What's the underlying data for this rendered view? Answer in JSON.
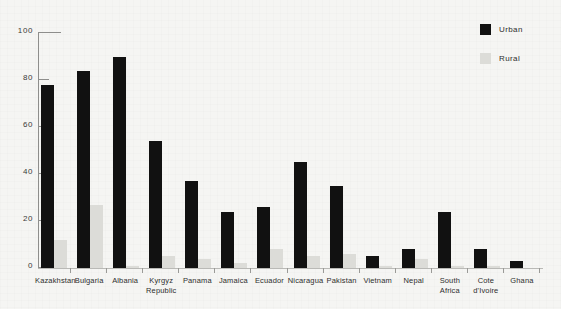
{
  "chart_data": {
    "type": "bar",
    "title": "",
    "xlabel": "",
    "ylabel": "",
    "ylim": [
      0,
      100
    ],
    "yticks": [
      0,
      20,
      40,
      60,
      80,
      100
    ],
    "grid": false,
    "legend_position": "top-right",
    "categories": [
      "Kazakhstan",
      "Bulgaria",
      "Albania",
      "Kyrgyz Republic",
      "Panama",
      "Jamaica",
      "Ecuador",
      "Nicaragua",
      "Pakistan",
      "Vietnam",
      "Nepal",
      "South Africa",
      "Cote d'Ivoire",
      "Ghana"
    ],
    "series": [
      {
        "name": "Urban",
        "color": "#111111",
        "values": [
          78,
          84,
          90,
          54,
          37,
          24,
          26,
          45,
          35,
          5,
          8,
          24,
          8,
          3
        ]
      },
      {
        "name": "Rural",
        "color": "#dcdcd8",
        "values": [
          12,
          27,
          1,
          5,
          4,
          2,
          8,
          5,
          6,
          1,
          4,
          1,
          1,
          0
        ]
      }
    ]
  },
  "legend": {
    "items": [
      {
        "label": "Urban",
        "color": "#111111"
      },
      {
        "label": "Rural",
        "color": "#dcdcd8"
      }
    ]
  },
  "axes": {
    "y_tick_labels": [
      "0",
      "20",
      "40",
      "60",
      "80",
      "100"
    ]
  }
}
